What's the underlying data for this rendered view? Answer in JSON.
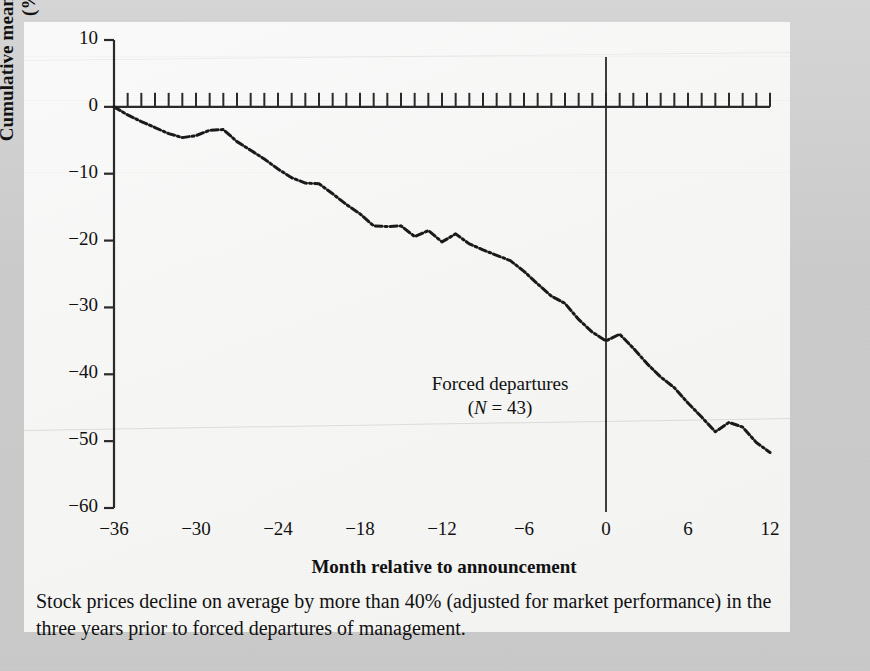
{
  "figure": {
    "axis_y_label": "Cumulative mean prediction error (%)",
    "axis_x_label": "Month relative to announcement",
    "annotation_line1": "Forced departures",
    "annotation_line2_prefix": "(",
    "annotation_line2_italic": "N",
    "annotation_line2_suffix": " = 43)",
    "annotation_full": "Forced departures (N = 43)",
    "caption": "Stock prices decline on average by more than 40% (adjusted for market performance) in the three years prior to forced departures of management.",
    "event_marker_month": 0
  },
  "chart_data": {
    "type": "line",
    "title": "",
    "subtitle": "",
    "xlabel": "Month relative to announcement",
    "ylabel": "Cumulative mean prediction error (%)",
    "xlim": [
      -36,
      12
    ],
    "ylim": [
      -60,
      10
    ],
    "xticks": [
      -36,
      -30,
      -24,
      -18,
      -12,
      -6,
      0,
      6,
      12
    ],
    "xtick_labels": [
      "−36",
      "−30",
      "−24",
      "−18",
      "−12",
      "−6",
      "0",
      "6",
      "12"
    ],
    "yticks": [
      10,
      0,
      -10,
      -20,
      -30,
      -40,
      -50,
      -60
    ],
    "ytick_labels": [
      "10",
      "0",
      "−10",
      "−20",
      "−30",
      "−40",
      "−50",
      "−60"
    ],
    "minor_xtick_interval": 1,
    "grid": false,
    "legend": null,
    "line_style": "dotted-dashed",
    "line_color": "#1a1a1a",
    "annotations": [
      {
        "text": "Forced departures (N = 43)",
        "x": -6.5,
        "y": -42.5
      },
      {
        "text": "vertical reference line at month 0",
        "x": 0,
        "y": null
      }
    ],
    "series": [
      {
        "name": "Cumulative mean prediction error",
        "x": [
          -36,
          -35,
          -34,
          -33,
          -32,
          -31,
          -30,
          -29,
          -28,
          -27,
          -26,
          -25,
          -24,
          -23,
          -22,
          -21,
          -20,
          -19,
          -18,
          -17,
          -16,
          -15,
          -14,
          -13,
          -12,
          -11,
          -10,
          -9,
          -8,
          -7,
          -6,
          -5,
          -4,
          -3,
          -2,
          -1,
          0,
          1,
          2,
          3,
          4,
          5,
          6,
          7,
          8,
          9,
          10,
          11,
          12
        ],
        "values": [
          0.0,
          -1.2,
          -2.2,
          -3.1,
          -4.0,
          -4.6,
          -4.3,
          -3.5,
          -3.4,
          -5.2,
          -6.5,
          -7.8,
          -9.3,
          -10.6,
          -11.4,
          -11.5,
          -13.0,
          -14.6,
          -16.0,
          -17.8,
          -17.9,
          -17.8,
          -19.4,
          -18.5,
          -20.2,
          -19.0,
          -20.5,
          -21.4,
          -22.2,
          -23.0,
          -24.6,
          -26.5,
          -28.3,
          -29.4,
          -31.8,
          -33.7,
          -35.0,
          -34.0,
          -36.1,
          -38.4,
          -40.4,
          -42.0,
          -44.3,
          -46.4,
          -48.6,
          -47.2,
          -47.9,
          -50.2,
          -51.7
        ]
      }
    ],
    "note_values_are_percent": true
  }
}
